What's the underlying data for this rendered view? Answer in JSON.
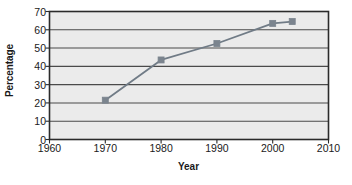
{
  "chart_data": {
    "type": "line",
    "title": "",
    "xlabel": "Year",
    "ylabel": "Percentage",
    "xlim": [
      1960,
      2010
    ],
    "ylim": [
      0,
      70
    ],
    "xticks": [
      1960,
      1970,
      1980,
      1990,
      2000,
      2010
    ],
    "yticks": [
      0,
      10,
      20,
      30,
      40,
      50,
      60,
      70
    ],
    "grid": "horizontal",
    "legend": "none",
    "x": [
      1970,
      1980,
      1990,
      2000,
      2003.5
    ],
    "values": [
      21.5,
      43.5,
      52.5,
      63.5,
      64.5
    ],
    "series": [
      {
        "name": "Percentage",
        "x": [
          1970,
          1980,
          1990,
          2000,
          2003.5
        ],
        "values": [
          21.5,
          43.5,
          52.5,
          63.5,
          64.5
        ],
        "marker": "square",
        "color": "#707b86"
      }
    ],
    "colors": {
      "line": "#707b86",
      "marker": "#7b848e",
      "plot_background": "#ebebeb",
      "plot_border": "#2b2b2b",
      "gridline": "#4a4a4a",
      "text": "#1a1a1a",
      "page_background": "#ffffff"
    }
  },
  "axes": {
    "y_title": "Percentage",
    "x_title": "Year",
    "y_tick_labels": [
      "70",
      "60",
      "50",
      "40",
      "30",
      "20",
      "10",
      "0"
    ],
    "x_tick_labels": [
      "1960",
      "1970",
      "1980",
      "1990",
      "2000",
      "2010"
    ]
  }
}
